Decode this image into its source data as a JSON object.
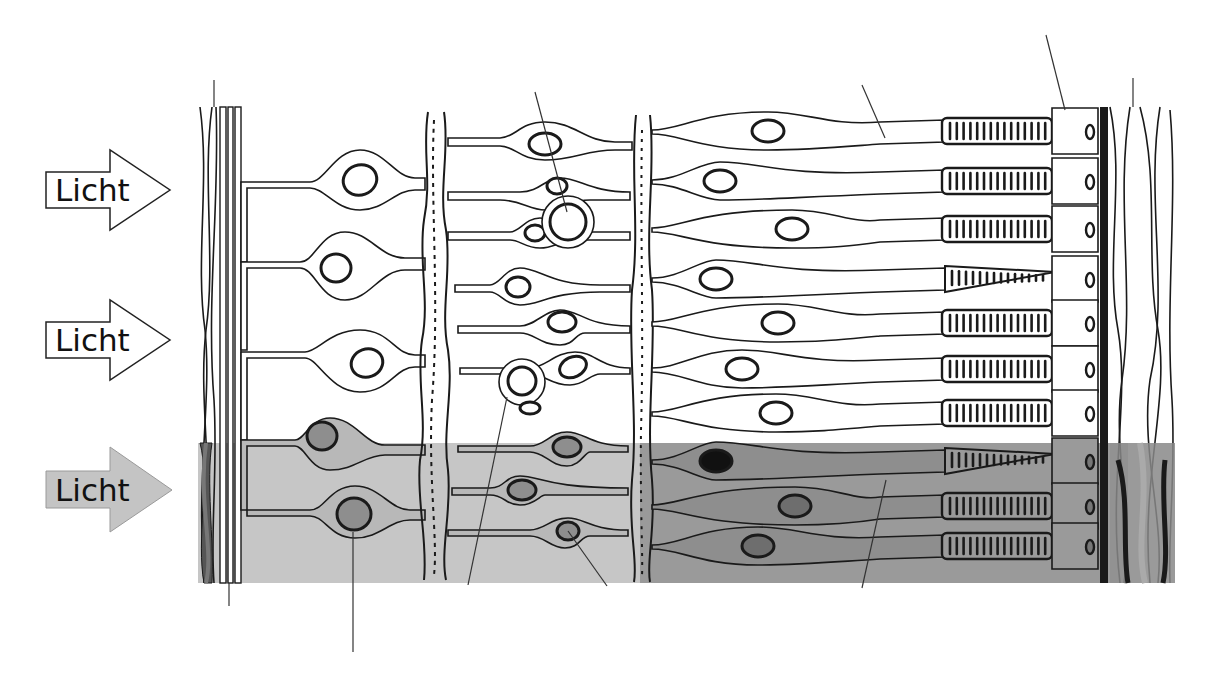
{
  "diagram": {
    "arrows": [
      {
        "label": "Licht",
        "style": "outline"
      },
      {
        "label": "Licht",
        "style": "outline"
      },
      {
        "label": "Licht",
        "style": "shaded"
      }
    ],
    "colors": {
      "outline": "#1a1a1a",
      "shade_light": "#b8b8b8",
      "shade_dark": "#8a8a8a",
      "arrow_shaded_fill": "#c4c4c4",
      "background": "#ffffff"
    },
    "highlighted_rows": 3
  }
}
